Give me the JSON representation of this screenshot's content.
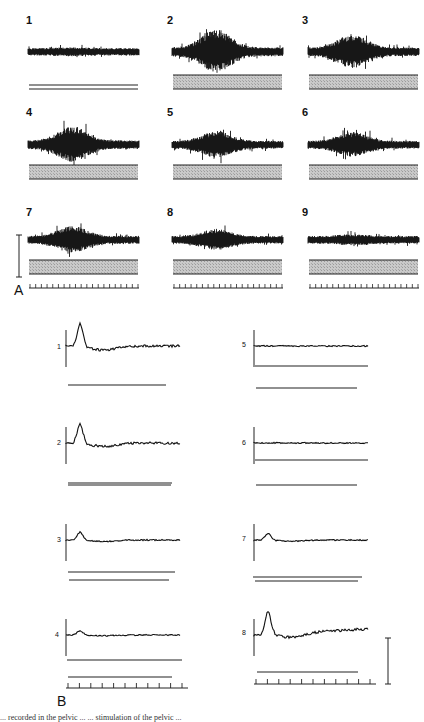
{
  "figure": {
    "panel_a": {
      "letter": "A",
      "traces": [
        {
          "id": "1",
          "label": "1",
          "amplitude": 0.18,
          "burst": 0.05
        },
        {
          "id": "2",
          "label": "2",
          "amplitude": 0.35,
          "burst": 1.0
        },
        {
          "id": "3",
          "label": "3",
          "amplitude": 0.3,
          "burst": 0.75
        },
        {
          "id": "4",
          "label": "4",
          "amplitude": 0.3,
          "burst": 0.8
        },
        {
          "id": "5",
          "label": "5",
          "amplitude": 0.22,
          "burst": 0.55
        },
        {
          "id": "6",
          "label": "6",
          "amplitude": 0.22,
          "burst": 0.5
        },
        {
          "id": "7",
          "label": "7",
          "amplitude": 0.22,
          "burst": 0.55
        },
        {
          "id": "8",
          "label": "8",
          "amplitude": 0.18,
          "burst": 0.4
        },
        {
          "id": "9",
          "label": "9",
          "amplitude": 0.2,
          "burst": 0.1
        }
      ],
      "time_ticks": 20
    },
    "panel_b": {
      "letter": "B",
      "traces": [
        {
          "id": "1",
          "label": "1",
          "peak": 1.0
        },
        {
          "id": "2",
          "label": "2",
          "peak": 0.85
        },
        {
          "id": "3",
          "label": "3",
          "peak": 0.35
        },
        {
          "id": "4",
          "label": "4",
          "peak": 0.2
        },
        {
          "id": "5",
          "label": "5",
          "peak": 0.0
        },
        {
          "id": "6",
          "label": "6",
          "peak": 0.0
        },
        {
          "id": "7",
          "label": "7",
          "peak": 0.3
        },
        {
          "id": "8",
          "label": "8",
          "peak": 1.0
        }
      ],
      "time_ticks": 11
    },
    "caption_fragment": "... recorded in the pelvic ...                   ... stimulation of the pelvic ..."
  },
  "chart_data": [
    {
      "type": "line",
      "title": "A",
      "subtype": "raw nerve activity traces with stimulus bars",
      "series": [
        {
          "name": "1",
          "relative_activity": 0.1,
          "stimulus_bar": "double line"
        },
        {
          "name": "2",
          "relative_activity": 1.0,
          "stimulus_bar": "shaded"
        },
        {
          "name": "3",
          "relative_activity": 0.8,
          "stimulus_bar": "shaded"
        },
        {
          "name": "4",
          "relative_activity": 0.8,
          "stimulus_bar": "shaded"
        },
        {
          "name": "5",
          "relative_activity": 0.55,
          "stimulus_bar": "shaded"
        },
        {
          "name": "6",
          "relative_activity": 0.5,
          "stimulus_bar": "shaded"
        },
        {
          "name": "7",
          "relative_activity": 0.55,
          "stimulus_bar": "shaded"
        },
        {
          "name": "8",
          "relative_activity": 0.4,
          "stimulus_bar": "shaded"
        },
        {
          "name": "9",
          "relative_activity": 0.15,
          "stimulus_bar": "shaded"
        }
      ],
      "xlabel": "",
      "ylabel": "",
      "scale_bar": "vertical calibration bar left of trace 7",
      "time_ticks": 20
    },
    {
      "type": "line",
      "title": "B",
      "subtype": "integrated activity traces",
      "series": [
        {
          "name": "1",
          "peak_relative": 1.0,
          "baseline_after": "slightly below then recovers"
        },
        {
          "name": "2",
          "peak_relative": 0.85,
          "baseline_after": "noisy plateau"
        },
        {
          "name": "3",
          "peak_relative": 0.35,
          "baseline_after": "flat"
        },
        {
          "name": "4",
          "peak_relative": 0.2,
          "baseline_after": "flat"
        },
        {
          "name": "5",
          "peak_relative": 0.0,
          "baseline_after": "flat"
        },
        {
          "name": "6",
          "peak_relative": 0.0,
          "baseline_after": "flat"
        },
        {
          "name": "7",
          "peak_relative": 0.3,
          "baseline_after": "flat"
        },
        {
          "name": "8",
          "peak_relative": 1.0,
          "baseline_after": "slowly rising"
        }
      ],
      "xlabel": "",
      "ylabel": "",
      "scale_bar": "vertical calibration bar right of trace 8",
      "time_ticks": 11
    }
  ]
}
